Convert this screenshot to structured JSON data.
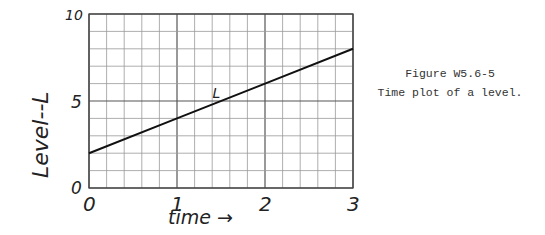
{
  "chart_data": {
    "type": "line",
    "title": "",
    "xlabel": "time →",
    "ylabel": "Level--L",
    "xlim": [
      0,
      3
    ],
    "ylim": [
      0,
      10
    ],
    "x_ticks": [
      "0",
      "1",
      "2",
      "3"
    ],
    "y_ticks": [
      "0",
      "5",
      "10"
    ],
    "grid": true,
    "grid_minor_x_per_unit": 5,
    "grid_minor_y_per_unit": 1,
    "series": [
      {
        "name": "L",
        "x": [
          0,
          1,
          2,
          3
        ],
        "values": [
          2,
          4,
          6,
          8
        ]
      }
    ],
    "annotations": [
      {
        "text": "L",
        "x": 1.45,
        "y": 5.3
      }
    ],
    "legend": "none"
  },
  "caption": {
    "figure_label": "Figure W5.6-5",
    "text": "Time plot of a level."
  }
}
